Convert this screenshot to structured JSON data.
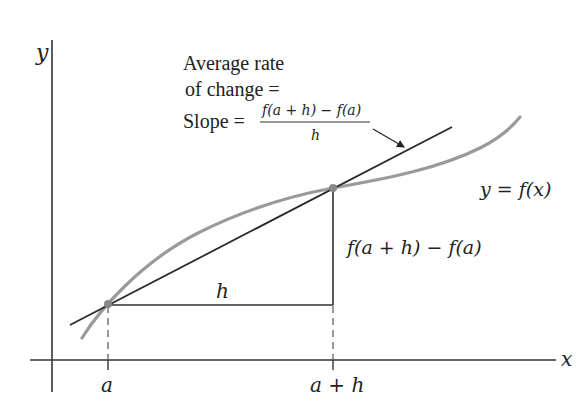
{
  "diagram": {
    "axes": {
      "x_label": "x",
      "y_label": "y"
    },
    "annotation": {
      "line1": "Average rate",
      "line2": "of change =",
      "line3_prefix": "Slope =",
      "fraction_numerator": "f(a + h) − f(a)",
      "fraction_denominator": "h"
    },
    "curve_label": "y = f(x)",
    "rise_label": "f(a + h) − f(a)",
    "run_label": "h",
    "tick_labels": {
      "a": "a",
      "a_plus_h": "a + h"
    },
    "colors": {
      "curve": "#999999",
      "secant": "#2b2b2b",
      "axes": "#333333",
      "points": "#888888"
    }
  }
}
